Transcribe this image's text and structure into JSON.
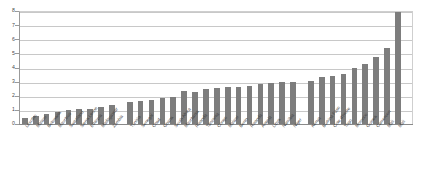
{
  "chart_data": {
    "type": "bar",
    "title": "",
    "subtitle": "",
    "xlabel": "",
    "ylabel": "",
    "ylim": [
      0,
      8
    ],
    "ytick_labels": [
      "0",
      "1",
      "2",
      "3",
      "4",
      "5",
      "6",
      "7",
      "8"
    ],
    "ytick_values": [
      0,
      1,
      2,
      3,
      4,
      5,
      6,
      7,
      8
    ],
    "grid": true,
    "legend": false,
    "legend_position": "none",
    "bar_color": "#7d7d7d",
    "grid_color": "#c8c8c8",
    "axis_color": "#8a8a8a",
    "label_rotation_degrees": -52,
    "group_gaps_after_index": [
      8,
      24
    ],
    "categories": [
      "Lesotho",
      "Malawi",
      "Botswana",
      "Mauritius",
      "Swaziland",
      "Sierra Leone",
      "Ethiopia",
      "Madagascar",
      "Zambia",
      "Tunisia",
      "Senegal",
      "Chad",
      "Ghana",
      "South Africa",
      "Mauritania",
      "Rwanda",
      "Tanzania",
      "Congo",
      "Malawi",
      "Benin",
      "Rwanda",
      "Angola",
      "Libya",
      "Namibia",
      "Niger",
      "Kenya",
      "Burkina Faso",
      "Cote d'Ivoire",
      "Togo",
      "Morocco",
      "Guinea",
      "Cameroon",
      "Mali"
    ],
    "values": [
      0.45,
      0.55,
      0.7,
      0.85,
      1.0,
      1.05,
      1.05,
      1.2,
      1.35,
      1.55,
      1.6,
      1.7,
      1.85,
      1.9,
      2.35,
      2.3,
      2.5,
      2.55,
      2.6,
      2.65,
      2.7,
      2.8,
      2.9,
      2.95,
      3.0,
      3.05,
      3.3,
      3.4,
      3.55,
      3.95,
      4.25,
      4.75,
      5.35
    ],
    "final_value": 7.9,
    "final_category": "Mali"
  }
}
